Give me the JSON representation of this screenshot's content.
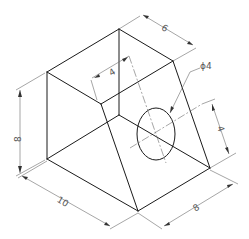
{
  "drawing": {
    "type": "isometric-technical-drawing",
    "header_text": "",
    "line_color": "#1a1a1a",
    "dimension_color": "#6a6a6a",
    "dimensions": {
      "top_depth": "6",
      "top_face_offset": "4",
      "hole_diameter": "ϕ4",
      "hole_height": "4",
      "left_height": "8",
      "bottom_length": "10",
      "bottom_depth": "8"
    }
  }
}
